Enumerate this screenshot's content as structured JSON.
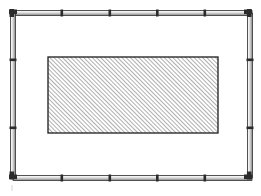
{
  "figure": {
    "type": "technical-line-drawing",
    "canvas": {
      "width": 261,
      "height": 196,
      "background": "#ffffff"
    },
    "colors": {
      "line": "#1a1a1a",
      "tube_fill_light": "#f2f2f2",
      "tube_fill_mid": "#bdbdbd",
      "tube_fill_dark": "#8a8a8a",
      "joint": "#2b2b2b",
      "hatch_line": "#4d4d4d",
      "panel_fill": "#ffffff",
      "panel_border": "#1c1c1c",
      "faint_mark": "#c8c8c8"
    },
    "outer_frame": {
      "name": "segmented tubular frame",
      "left": 11,
      "top": 11,
      "right": 250,
      "bottom": 178,
      "tube_thickness": 5,
      "segment_count_horizontal": 5,
      "segment_count_vertical": 3,
      "top_joints_x": [
        13,
        62,
        110,
        157,
        205,
        252
      ],
      "bottom_joints_x": [
        13,
        62,
        110,
        157,
        205,
        252
      ],
      "left_joints_y": [
        13,
        60,
        128,
        178
      ],
      "right_joints_y": [
        13,
        60,
        128,
        178
      ]
    },
    "inner_panel": {
      "name": "hatched rectangle",
      "x": 48,
      "y": 57,
      "width": 170,
      "height": 76,
      "hatch": {
        "pattern": "diagonal-45",
        "direction": "bottom-left-to-top-right",
        "spacing_px": 3,
        "stroke_width": 0.9
      }
    },
    "annotations": {
      "faint_mark": {
        "x": 12,
        "y": 188,
        "label": "registration tick"
      }
    }
  },
  "labels": {
    "figure_label": "",
    "caption": ""
  }
}
